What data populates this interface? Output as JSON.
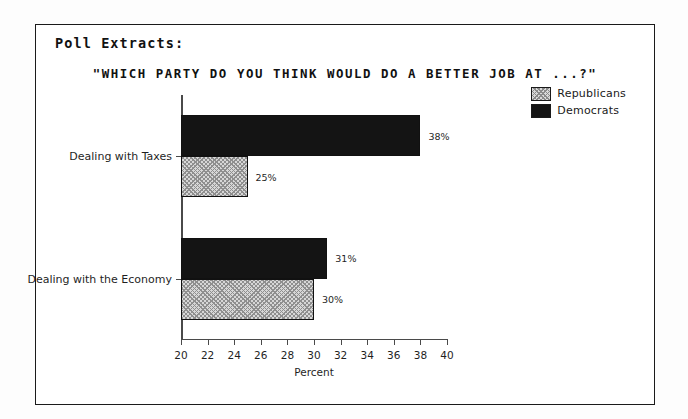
{
  "header": {
    "section_label": "Poll Extracts:"
  },
  "chart_data": {
    "type": "bar",
    "orientation": "horizontal",
    "title": "\"WHICH PARTY DO YOU THINK WOULD DO A BETTER JOB AT ...?\"",
    "xlabel": "Percent",
    "ylabel": "",
    "xlim": [
      20,
      40
    ],
    "xticks": [
      20,
      22,
      24,
      26,
      28,
      30,
      32,
      34,
      36,
      38,
      40
    ],
    "xtick_labels": [
      "20",
      "22",
      "24",
      "26",
      "28",
      "30",
      "32",
      "34",
      "36",
      "38",
      "40"
    ],
    "grid": false,
    "legend_position": "top-right",
    "categories": [
      "Dealing with Taxes",
      "Dealing with the Economy"
    ],
    "series": [
      {
        "name": "Republicans",
        "color": "#d7d7d7",
        "pattern": "crosshatch",
        "values": [
          25,
          30
        ],
        "value_labels": [
          "25%",
          "30%"
        ]
      },
      {
        "name": "Democrats",
        "color": "#141414",
        "pattern": "solid",
        "values": [
          38,
          31
        ],
        "value_labels": [
          "38%",
          "31%"
        ]
      }
    ]
  }
}
